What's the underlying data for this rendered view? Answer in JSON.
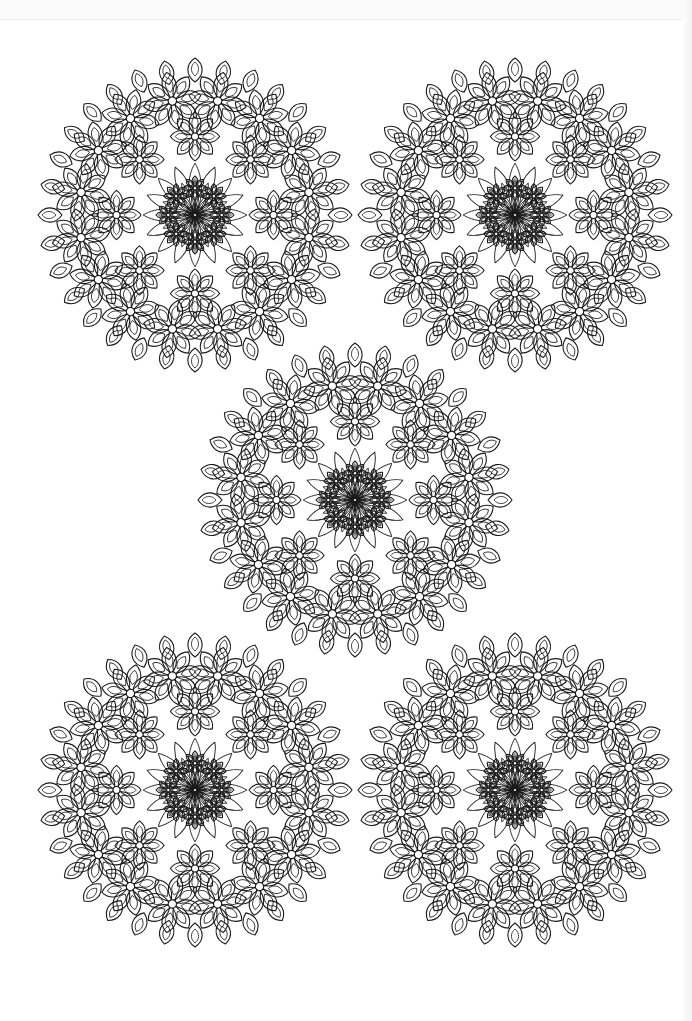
{
  "page": {
    "type": "coloring-page",
    "background": "#ffffff",
    "line_color": "#1a1a1a"
  },
  "mandalas": [
    {
      "id": "top-left",
      "cx": 195,
      "cy": 215,
      "r": 157
    },
    {
      "id": "top-right",
      "cx": 515,
      "cy": 215,
      "r": 157
    },
    {
      "id": "middle",
      "cx": 355,
      "cy": 500,
      "r": 157
    },
    {
      "id": "bottom-left",
      "cx": 195,
      "cy": 790,
      "r": 157
    },
    {
      "id": "bottom-right",
      "cx": 515,
      "cy": 790,
      "r": 157
    }
  ],
  "pattern": {
    "outer_flower_count": 16,
    "inner_ring_flower_count": 8,
    "center_rosette_petals": 16
  }
}
